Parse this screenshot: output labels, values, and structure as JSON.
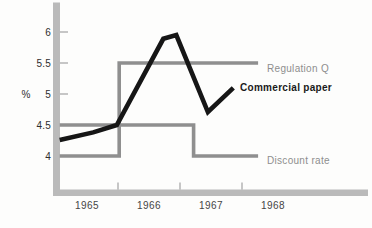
{
  "figure": {
    "width_px": 372,
    "height_px": 228,
    "background": "#fdfdfc",
    "colors": {
      "axis_bar": "#bababa",
      "axis_tick": "#c6c6c6",
      "tick_label": "#2e2e2e",
      "year_label": "#454545",
      "gray_series": "#8f8f8f",
      "gray_label": "#8e8e8e",
      "black_series": "#161616",
      "black_label": "#1a1a1a"
    }
  },
  "chart_data": {
    "type": "line",
    "title": "",
    "xlabel": "",
    "ylabel": "%",
    "x_unit": "year",
    "xlim": [
      1965,
      1970
    ],
    "ylim": [
      3.4,
      6.5
    ],
    "grid": false,
    "legend_position": "inline-right-of-line",
    "y_ticks": {
      "values": [
        6,
        5.5,
        5,
        4.5,
        4
      ],
      "labels": [
        "6",
        "5.5",
        "5",
        "4.5",
        "4"
      ]
    },
    "x_year_labels": [
      "1965",
      "1966",
      "1967",
      "1968"
    ],
    "x_boundary_tick_years": [
      1966,
      1967,
      1968
    ],
    "series": [
      {
        "name": "Regulation Q",
        "role": "gray",
        "points": [
          [
            1965.06,
            4.0
          ],
          [
            1966.02,
            4.0
          ],
          [
            1966.02,
            5.5
          ],
          [
            1968.26,
            5.5
          ]
        ]
      },
      {
        "name": "Discount rate",
        "role": "gray",
        "points": [
          [
            1965.06,
            4.5
          ],
          [
            1967.22,
            4.5
          ],
          [
            1967.22,
            4.0
          ],
          [
            1968.26,
            4.0
          ]
        ]
      },
      {
        "name": "Commercial paper",
        "role": "black",
        "points": [
          [
            1965.06,
            4.26
          ],
          [
            1965.6,
            4.38
          ],
          [
            1965.98,
            4.5
          ],
          [
            1966.73,
            5.89
          ],
          [
            1966.94,
            5.95
          ],
          [
            1967.45,
            4.71
          ],
          [
            1967.86,
            5.1
          ]
        ]
      }
    ],
    "annotations": [
      {
        "text": "Regulation Q",
        "series": "Regulation Q",
        "x_px": 267,
        "cy_px": 69,
        "bold": false,
        "color_role": "gray"
      },
      {
        "text": "Commercial paper",
        "series": "Commercial paper",
        "x_px": 240,
        "cy_px": 87.5,
        "bold": true,
        "color_role": "black"
      },
      {
        "text": "Discount rate",
        "series": "Discount rate",
        "x_px": 267,
        "cy_px": 160.5,
        "bold": false,
        "color_role": "gray"
      }
    ]
  }
}
